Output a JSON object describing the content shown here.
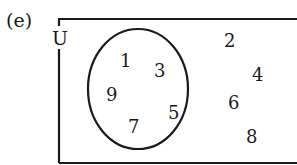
{
  "question_label": "(e)",
  "universal_set_label": "U",
  "diagram": {
    "type": "venn",
    "universal_set": "U",
    "sets": [
      {
        "name": "A",
        "elements": [
          "1",
          "3",
          "9",
          "5",
          "7"
        ]
      }
    ],
    "outside_elements": [
      "2",
      "4",
      "6",
      "8"
    ]
  },
  "inside_numbers": [
    {
      "value": "1",
      "x": 120,
      "y": 52
    },
    {
      "value": "3",
      "x": 154,
      "y": 62
    },
    {
      "value": "9",
      "x": 106,
      "y": 86
    },
    {
      "value": "5",
      "x": 168,
      "y": 104
    },
    {
      "value": "7",
      "x": 128,
      "y": 118
    }
  ],
  "outside_numbers": [
    {
      "value": "2",
      "x": 224,
      "y": 32
    },
    {
      "value": "4",
      "x": 252,
      "y": 66
    },
    {
      "value": "6",
      "x": 228,
      "y": 94
    },
    {
      "value": "8",
      "x": 246,
      "y": 128
    }
  ],
  "colors": {
    "stroke": "#1a1a1a",
    "background": "#ffffff"
  }
}
